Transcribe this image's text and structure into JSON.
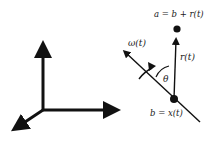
{
  "diagram": {
    "coordinate_frame": {
      "axes": [
        "vertical-axis",
        "horizontal-axis",
        "depth-axis"
      ]
    },
    "labels": {
      "point_a": "a = b + r(t)",
      "point_b": "b = x(t)",
      "omega": "ω(t)",
      "r_vector": "r(t)",
      "angle": "θ"
    },
    "colors": {
      "stroke": "#111111",
      "background": "#ffffff"
    }
  }
}
